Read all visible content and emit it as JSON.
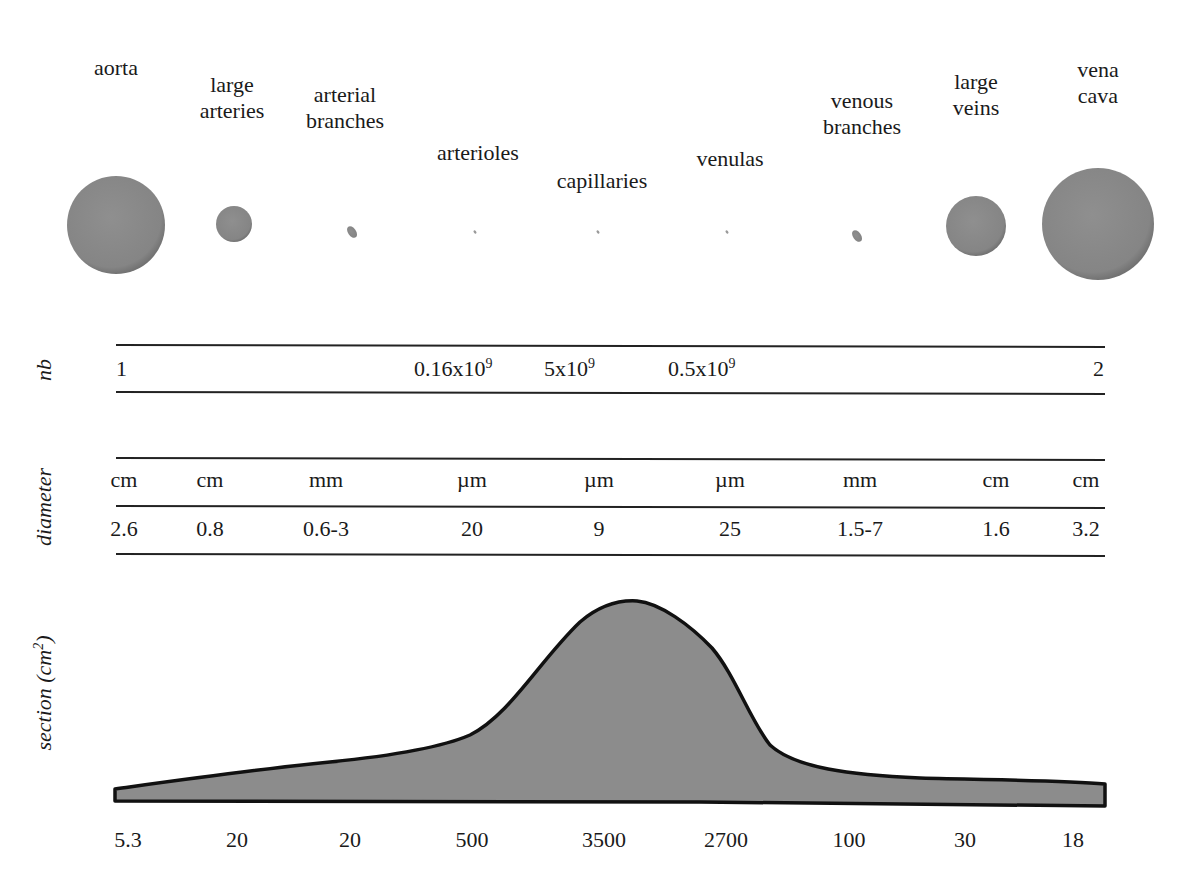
{
  "vessels": [
    {
      "name": "aorta",
      "lines": [
        "aorta"
      ],
      "label_x": 116,
      "label_y": 55,
      "cx": 116,
      "cy": 225,
      "r": 49
    },
    {
      "name": "large arteries",
      "lines": [
        "large",
        "arteries"
      ],
      "label_x": 232,
      "label_y": 72,
      "cx": 234,
      "cy": 224,
      "r": 18
    },
    {
      "name": "arterial branches",
      "lines": [
        "arterial",
        "branches"
      ],
      "label_x": 345,
      "label_y": 82,
      "cx": 352,
      "cy": 232,
      "r": 5
    },
    {
      "name": "arterioles",
      "lines": [
        "arterioles"
      ],
      "label_x": 478,
      "label_y": 140,
      "cx": 475,
      "cy": 232,
      "r": 1.5
    },
    {
      "name": "capillaries",
      "lines": [
        "capillaries"
      ],
      "label_x": 602,
      "label_y": 168,
      "cx": 598,
      "cy": 232,
      "r": 1.5
    },
    {
      "name": "venulas",
      "lines": [
        "venulas"
      ],
      "label_x": 730,
      "label_y": 146,
      "cx": 727,
      "cy": 232,
      "r": 1.5
    },
    {
      "name": "venous branches",
      "lines": [
        "venous",
        "branches"
      ],
      "label_x": 862,
      "label_y": 88,
      "cx": 857,
      "cy": 236,
      "r": 5
    },
    {
      "name": "large veins",
      "lines": [
        "large",
        "veins"
      ],
      "label_x": 976,
      "label_y": 69,
      "cx": 976,
      "cy": 226,
      "r": 30
    },
    {
      "name": "vena cava",
      "lines": [
        "vena",
        "cava"
      ],
      "label_x": 1098,
      "label_y": 57,
      "cx": 1098,
      "cy": 224,
      "r": 56
    }
  ],
  "rows": {
    "nb": {
      "label": "nb",
      "cells": [
        {
          "text": "1",
          "x": 116,
          "align": "left"
        },
        {
          "text": "0.16x10",
          "sup": "9",
          "x": 414,
          "align": "left"
        },
        {
          "text": "5x10",
          "sup": "9",
          "x": 544,
          "align": "left"
        },
        {
          "text": "0.5x10",
          "sup": "9",
          "x": 668,
          "align": "left"
        },
        {
          "text": "2",
          "x": 1104,
          "align": "right"
        }
      ]
    },
    "diameter": {
      "label": "diameter",
      "units": [
        "cm",
        "cm",
        "mm",
        "µm",
        "µm",
        "µm",
        "mm",
        "cm",
        "cm"
      ],
      "values": [
        "2.6",
        "0.8",
        "0.6-3",
        "20",
        "9",
        "25",
        "1.5-7",
        "1.6",
        "3.2"
      ],
      "col_x": [
        124,
        210,
        326,
        472,
        599,
        730,
        860,
        996,
        1086
      ]
    },
    "section": {
      "label": "section (cm",
      "label_sup": "2",
      "label_close": ")"
    }
  },
  "chart_data": {
    "type": "area",
    "title": "",
    "ylabel": "section (cm²)",
    "xlabel": "",
    "categories": [
      "aorta",
      "large arteries",
      "arterial branches",
      "arterioles",
      "capillaries",
      "venulas",
      "venous branches",
      "large veins",
      "vena cava"
    ],
    "values": [
      5.3,
      20,
      20,
      500,
      3500,
      2700,
      100,
      30,
      18
    ],
    "tick_labels": [
      "5.3",
      "20",
      "20",
      "500",
      "3500",
      "2700",
      "100",
      "30",
      "18"
    ],
    "tick_x": [
      128,
      237,
      350,
      472,
      604,
      726,
      849,
      965,
      1073
    ],
    "grid": false,
    "legend": null
  },
  "colors": {
    "vessel_fill": "#8a8a8a",
    "area_fill": "#8c8c8c",
    "outline": "#111111",
    "rule": "#222222",
    "text": "#1a1a1a"
  }
}
